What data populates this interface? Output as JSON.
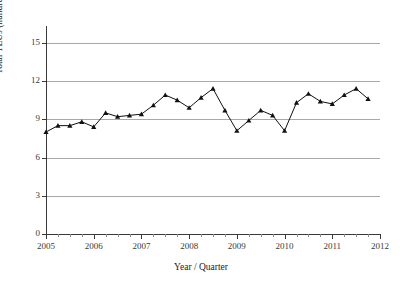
{
  "chart_data": {
    "type": "line",
    "title": "",
    "xlabel": "Year / Quarter",
    "ylabel": "Total TEUs (hundred thousands)",
    "ylim": [
      0,
      16
    ],
    "xlim": [
      2005,
      2012
    ],
    "yticks": [
      0,
      3,
      6,
      9,
      12,
      15
    ],
    "ytick_labels": [
      "0",
      "3",
      "6",
      "9",
      "12",
      "15"
    ],
    "xticks": [
      2005,
      2006,
      2007,
      2008,
      2009,
      2010,
      2011,
      2012
    ],
    "xtick_labels": [
      "2005",
      "2006",
      "2007",
      "2008",
      "2009",
      "2010",
      "2011",
      "2012"
    ],
    "grid": "horizontal",
    "legend": "none",
    "marker": "triangle",
    "line_color": "#111111",
    "grid_color": "#a8a8a8",
    "axis_color": "#3a3a3a",
    "x": [
      2005.0,
      2005.25,
      2005.5,
      2005.75,
      2006.0,
      2006.25,
      2006.5,
      2006.75,
      2007.0,
      2007.25,
      2007.5,
      2007.75,
      2008.0,
      2008.25,
      2008.5,
      2008.75,
      2009.0,
      2009.25,
      2009.5,
      2009.75,
      2010.0,
      2010.25,
      2010.5,
      2010.75,
      2011.0,
      2011.25,
      2011.5,
      2011.75
    ],
    "categories": [
      "2005 Q1",
      "2005 Q2",
      "2005 Q3",
      "2005 Q4",
      "2006 Q1",
      "2006 Q2",
      "2006 Q3",
      "2006 Q4",
      "2007 Q1",
      "2007 Q2",
      "2007 Q3",
      "2007 Q4",
      "2008 Q1",
      "2008 Q2",
      "2008 Q3",
      "2008 Q4",
      "2009 Q1",
      "2009 Q2",
      "2009 Q3",
      "2009 Q4",
      "2010 Q1",
      "2010 Q2",
      "2010 Q3",
      "2010 Q4",
      "2011 Q1",
      "2011 Q2",
      "2011 Q3",
      "2011 Q4"
    ],
    "values": [
      8.0,
      8.5,
      8.5,
      8.8,
      8.4,
      9.5,
      9.2,
      9.3,
      9.4,
      10.1,
      10.9,
      10.5,
      9.9,
      10.7,
      11.4,
      9.7,
      8.1,
      8.9,
      9.7,
      9.3,
      8.1,
      10.3,
      11.0,
      10.4,
      10.2,
      10.9,
      11.4,
      10.6
    ],
    "series": [
      {
        "name": "Total TEUs",
        "values": [
          8.0,
          8.5,
          8.5,
          8.8,
          8.4,
          9.5,
          9.2,
          9.3,
          9.4,
          10.1,
          10.9,
          10.5,
          9.9,
          10.7,
          11.4,
          9.7,
          8.1,
          8.9,
          9.7,
          9.3,
          8.1,
          10.3,
          11.0,
          10.4,
          10.2,
          10.9,
          11.4,
          10.6
        ]
      }
    ]
  }
}
